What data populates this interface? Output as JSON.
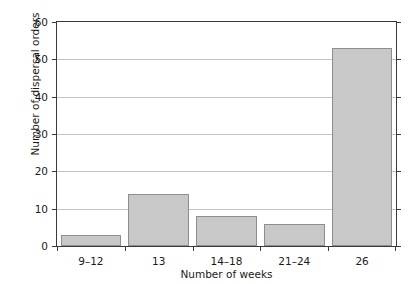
{
  "figure": {
    "title_remnant": "",
    "background_color": "#ffffff",
    "frame_color": "#3a3a3a",
    "grid_color": "#c4c4c4",
    "bar_fill_color": "#c8c8c8",
    "bar_border_color": "#8e8e8e"
  },
  "chart_data": {
    "type": "bar",
    "title": "",
    "xlabel": "Number of weeks",
    "ylabel": "Number of dispersal orders",
    "categories": [
      "9–12",
      "13",
      "14–18",
      "21–24",
      "26"
    ],
    "values": [
      3,
      14,
      8,
      6,
      53
    ],
    "ylim": [
      0,
      60
    ],
    "ytick_labels": [
      "0",
      "10",
      "20",
      "30",
      "40",
      "50",
      "60"
    ],
    "ytick_values": [
      0,
      10,
      20,
      30,
      40,
      50,
      60
    ],
    "grid": "horizontal",
    "legend": "none",
    "series": [
      {
        "name": "Number of dispersal orders",
        "values": [
          3,
          14,
          8,
          6,
          53
        ]
      }
    ]
  }
}
